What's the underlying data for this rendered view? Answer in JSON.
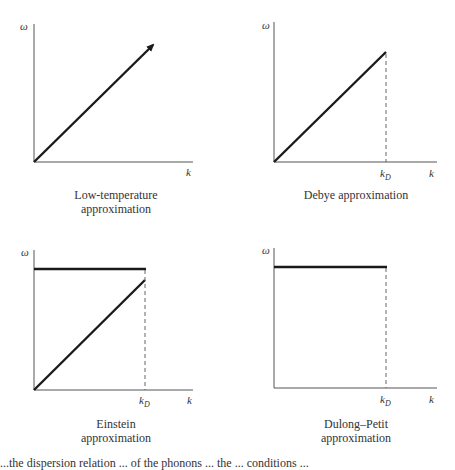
{
  "figure": {
    "panels": [
      {
        "id": "low-temperature",
        "y_label": "ω",
        "x_label": "k",
        "caption_line1": "Low-temperature",
        "caption_line2": "approximation",
        "curves": [
          {
            "type": "line-arrow",
            "from": [
              0,
              0
            ],
            "to": [
              1.0,
              1.0
            ]
          }
        ]
      },
      {
        "id": "debye",
        "y_label": "ω",
        "x_label": "k",
        "tick_label": "k",
        "tick_sub": "D",
        "caption_line1": "Debye approximation",
        "curves": [
          {
            "type": "line",
            "from": [
              0,
              0
            ],
            "to": [
              "k_D",
              "ω_D"
            ]
          },
          {
            "type": "dashed-vertical",
            "x": "k_D"
          }
        ]
      },
      {
        "id": "einstein",
        "y_label": "ω",
        "x_label": "k",
        "tick_label": "k",
        "tick_sub": "D",
        "caption_line1": "Einstein",
        "caption_line2": "approximation",
        "curves": [
          {
            "type": "horizontal",
            "y": "ω_E",
            "to": "k_D"
          },
          {
            "type": "line",
            "from": [
              0,
              0
            ],
            "to": [
              "k_D",
              "ω_D"
            ]
          },
          {
            "type": "dashed-vertical",
            "x": "k_D"
          }
        ]
      },
      {
        "id": "dulong-petit",
        "y_label": "ω",
        "x_label": "k",
        "tick_label": "k",
        "tick_sub": "D",
        "caption_line1": "Dulong–Petit",
        "caption_line2": "approximation",
        "curves": [
          {
            "type": "horizontal",
            "y": "ω_max",
            "to": "k_D"
          },
          {
            "type": "dashed-vertical",
            "x": "k_D"
          }
        ]
      }
    ],
    "footer_text_partial": "...the dispersion relation ... of the phonons ... the ... conditions ..."
  }
}
